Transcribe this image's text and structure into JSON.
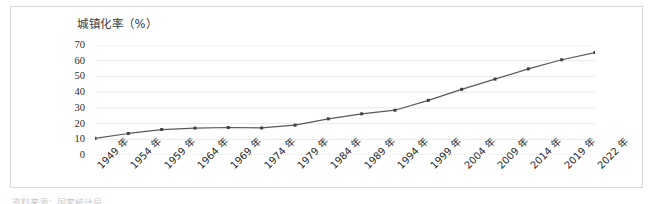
{
  "chart_data": {
    "type": "line",
    "title": "城镇化率（%）",
    "xlabel": "",
    "ylabel": "",
    "ylim": [
      0,
      70
    ],
    "yticks": [
      70,
      60,
      50,
      40,
      30,
      20,
      10,
      0
    ],
    "grid": true,
    "legend": false,
    "legend_position": "none",
    "categories": [
      "1949 年",
      "1954 年",
      "1959 年",
      "1964 年",
      "1969 年",
      "1974 年",
      "1979 年",
      "1984 年",
      "1989 年",
      "1994 年",
      "1999 年",
      "2004 年",
      "2009 年",
      "2014 年",
      "2019 年",
      "2022 年"
    ],
    "values": [
      10.6,
      13.7,
      16.2,
      17.1,
      17.5,
      17.2,
      19.0,
      23.0,
      26.2,
      28.5,
      34.8,
      41.8,
      48.3,
      54.8,
      60.6,
      65.2
    ],
    "series": [
      {
        "name": "城镇化率",
        "values": [
          10.6,
          13.7,
          16.2,
          17.1,
          17.5,
          17.2,
          19.0,
          23.0,
          26.2,
          28.5,
          34.8,
          41.8,
          48.3,
          54.8,
          60.6,
          65.2
        ]
      }
    ],
    "line_color": "#595959",
    "marker_color": "#404040",
    "grid_color": "#e9e9e9"
  },
  "figure": {
    "caption_clipped": "资料来源：国家统计局"
  }
}
